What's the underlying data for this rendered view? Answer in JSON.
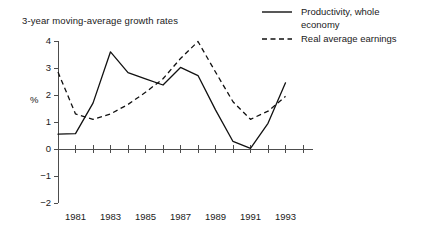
{
  "chart_data": {
    "type": "line",
    "title": "3-year moving-average growth rates",
    "xlabel": "",
    "ylabel": "%",
    "ylim": [
      -2,
      4
    ],
    "xlim": [
      1980,
      1994
    ],
    "yticks": [
      -2,
      -1,
      0,
      1,
      2,
      3,
      4
    ],
    "ytick_labels": [
      "−2",
      "−1",
      "0",
      "1",
      "2",
      "3",
      "4"
    ],
    "xticks": [
      1980,
      1981,
      1982,
      1983,
      1984,
      1985,
      1986,
      1987,
      1988,
      1989,
      1990,
      1991,
      1992,
      1993,
      1994
    ],
    "xtick_labels": [
      "",
      "1981",
      "",
      "1983",
      "",
      "1985",
      "",
      "1987",
      "",
      "1989",
      "",
      "1991",
      "",
      "1993",
      ""
    ],
    "grid": false,
    "legend_position": "top-right",
    "x": [
      1980,
      1981,
      1982,
      1983,
      1984,
      1985,
      1986,
      1987,
      1988,
      1989,
      1990,
      1991,
      1992,
      1993
    ],
    "series": [
      {
        "name": "Productivity, whole economy",
        "style": "solid",
        "values": [
          0.55,
          0.57,
          1.7,
          3.6,
          2.83,
          2.6,
          2.37,
          3.02,
          2.72,
          1.45,
          0.28,
          0.02,
          0.95,
          2.45
        ]
      },
      {
        "name": "Real average earnings",
        "style": "dashed",
        "values": [
          2.85,
          1.3,
          1.1,
          1.3,
          1.65,
          2.1,
          2.6,
          3.35,
          3.98,
          2.85,
          1.75,
          1.1,
          1.4,
          1.95
        ]
      }
    ]
  },
  "legend": {
    "items": [
      {
        "label": "Productivity, whole\neconomy",
        "style": "solid"
      },
      {
        "label": "Real average earnings",
        "style": "dashed"
      }
    ]
  }
}
